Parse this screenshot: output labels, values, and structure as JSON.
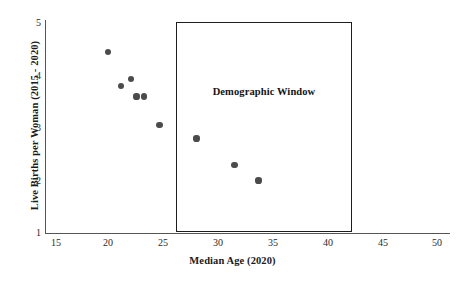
{
  "chart_data": {
    "type": "scatter",
    "title": "",
    "xlabel": "Median Age (2020)",
    "ylabel": "Live Births per Woman (2015 - 2020)",
    "xlim": [
      15,
      50
    ],
    "ylim": [
      1,
      5
    ],
    "xticks": [
      15,
      20,
      25,
      30,
      35,
      40,
      45,
      50
    ],
    "yticks": [
      1,
      2,
      3,
      4,
      5
    ],
    "grid": false,
    "legend": null,
    "marker_color": "#4b4b4b",
    "points": [
      {
        "x": 19.8,
        "y": 4.45
      },
      {
        "x": 21.0,
        "y": 3.8
      },
      {
        "x": 21.9,
        "y": 3.93
      },
      {
        "x": 22.4,
        "y": 3.6
      },
      {
        "x": 23.1,
        "y": 3.6
      },
      {
        "x": 24.5,
        "y": 3.05
      },
      {
        "x": 27.9,
        "y": 2.8
      },
      {
        "x": 31.4,
        "y": 2.3
      },
      {
        "x": 33.6,
        "y": 2.0
      }
    ],
    "annotations": [
      {
        "name": "demographic-window",
        "label": "Demographic Window",
        "shape": "rectangle",
        "x_range": [
          26,
          42
        ],
        "y_range": [
          1,
          5
        ],
        "border_color": "#1d1d1d"
      }
    ]
  },
  "axes": {
    "x": {
      "label": "Median Age (2020)",
      "ticks": [
        "15",
        "20",
        "25",
        "30",
        "35",
        "40",
        "45",
        "50"
      ]
    },
    "y": {
      "label": "Live Births per Woman (2015 - 2020)",
      "ticks": [
        "1",
        "2",
        "3",
        "4",
        "5"
      ]
    }
  },
  "window_box": {
    "label": "Demographic Window"
  }
}
